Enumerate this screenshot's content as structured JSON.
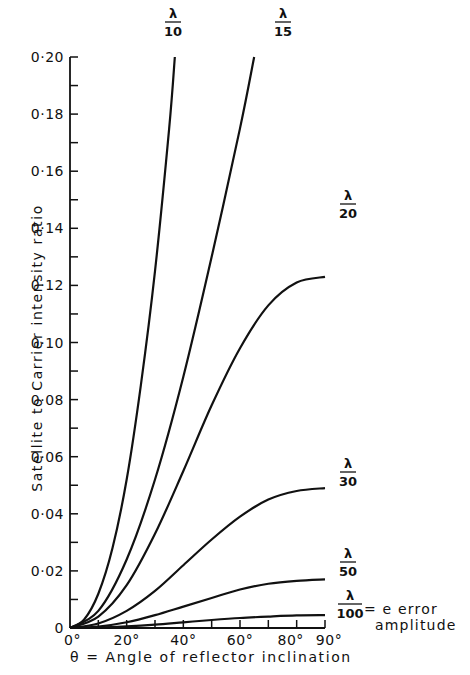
{
  "chart_data": {
    "type": "line",
    "title": "",
    "xlabel": "θ = Angle of reflector inclination",
    "ylabel": "Satellite to Carrier intensity ratio",
    "xlim": [
      0,
      90
    ],
    "ylim": [
      0,
      0.2
    ],
    "x_tick_labels": [
      "0°",
      "20°",
      "40°",
      "60°",
      "80°",
      "90°"
    ],
    "x_ticks": [
      0,
      20,
      40,
      60,
      80,
      90
    ],
    "x_minor_ticks": [
      10,
      30,
      50,
      70
    ],
    "y_tick_labels": [
      "0",
      "0·02",
      "0·04",
      "0·06",
      "0·08",
      "0·10",
      "0·12",
      "0·14",
      "0·16",
      "0·18",
      "0·20"
    ],
    "y_ticks": [
      0,
      0.02,
      0.04,
      0.06,
      0.08,
      0.1,
      0.12,
      0.14,
      0.16,
      0.18,
      0.2
    ],
    "grid": false,
    "legend": "inline labels at curve ends",
    "series_parameter": "e error amplitude",
    "annotation": "= e error amplitude",
    "series": [
      {
        "name": "λ/10",
        "num": "λ",
        "den": "10",
        "x": [
          0,
          5,
          10,
          15,
          20,
          25,
          30,
          35,
          37
        ],
        "values": [
          0,
          0.003,
          0.012,
          0.028,
          0.052,
          0.085,
          0.125,
          0.175,
          0.2
        ]
      },
      {
        "name": "λ/15",
        "num": "λ",
        "den": "15",
        "x": [
          0,
          10,
          20,
          30,
          40,
          50,
          60,
          65
        ],
        "values": [
          0,
          0.006,
          0.024,
          0.052,
          0.088,
          0.13,
          0.175,
          0.2
        ]
      },
      {
        "name": "λ/20",
        "num": "λ",
        "den": "20",
        "x": [
          0,
          10,
          20,
          30,
          40,
          50,
          60,
          70,
          80,
          90
        ],
        "values": [
          0,
          0.004,
          0.015,
          0.033,
          0.055,
          0.078,
          0.098,
          0.113,
          0.121,
          0.123
        ]
      },
      {
        "name": "λ/30",
        "num": "λ",
        "den": "30",
        "x": [
          0,
          10,
          20,
          30,
          40,
          50,
          60,
          70,
          80,
          90
        ],
        "values": [
          0,
          0.0016,
          0.006,
          0.013,
          0.022,
          0.031,
          0.039,
          0.045,
          0.048,
          0.049
        ]
      },
      {
        "name": "λ/50",
        "num": "λ",
        "den": "50",
        "x": [
          0,
          10,
          20,
          30,
          40,
          50,
          60,
          70,
          80,
          90
        ],
        "values": [
          0,
          0.0005,
          0.002,
          0.0045,
          0.0075,
          0.0105,
          0.0135,
          0.0155,
          0.0165,
          0.017
        ]
      },
      {
        "name": "λ/100",
        "num": "λ",
        "den": "100",
        "x": [
          0,
          10,
          20,
          30,
          40,
          50,
          60,
          70,
          80,
          90
        ],
        "values": [
          0,
          0.0002,
          0.0006,
          0.0012,
          0.002,
          0.0028,
          0.0035,
          0.004,
          0.0044,
          0.0045
        ]
      }
    ]
  },
  "colors": {
    "line": "#111111",
    "background": "#ffffff"
  }
}
